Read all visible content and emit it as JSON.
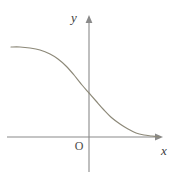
{
  "figure": {
    "background_color": "#ffffff",
    "width": 174,
    "height": 178
  },
  "axes": {
    "x_axis": {
      "label": "x",
      "color": "#8a8a8a",
      "start_x": 7,
      "end_x": 163,
      "y": 137,
      "arrow": "right"
    },
    "y_axis": {
      "label": "y",
      "color": "#8a8a8a",
      "x": 89,
      "start_y": 172,
      "end_y": 16,
      "arrow": "up"
    },
    "origin": {
      "label": "O",
      "color": "#4a4a4a",
      "x": 78,
      "y": 148
    }
  },
  "chart_data": {
    "type": "line",
    "title": "",
    "xlabel": "x",
    "ylabel": "y",
    "grid": false,
    "legend": null,
    "curve_color": "#8c8878",
    "origin_px": [
      89,
      137
    ],
    "xlim_px": [
      7,
      163
    ],
    "ylim_px": [
      16,
      172
    ],
    "points_px": [
      [
        11,
        47
      ],
      [
        20,
        47
      ],
      [
        30,
        48
      ],
      [
        40,
        50
      ],
      [
        50,
        54
      ],
      [
        58,
        59
      ],
      [
        66,
        66
      ],
      [
        74,
        75
      ],
      [
        82,
        85
      ],
      [
        89,
        93
      ],
      [
        96,
        101
      ],
      [
        104,
        110
      ],
      [
        112,
        118
      ],
      [
        120,
        124
      ],
      [
        128,
        129
      ],
      [
        136,
        133
      ],
      [
        144,
        135
      ],
      [
        152,
        136
      ],
      [
        160,
        137
      ]
    ],
    "series": [
      {
        "name": "y = f(x)",
        "x": [
          -8.5,
          -7.0,
          -5.5,
          -4.0,
          -2.5,
          -1.5,
          -0.5,
          0.0,
          0.5,
          1.5,
          2.5,
          4.0,
          5.5,
          7.0,
          8.5
        ],
        "y": [
          9.0,
          8.95,
          8.8,
          8.4,
          7.5,
          6.6,
          5.3,
          4.8,
          4.2,
          3.0,
          1.9,
          0.9,
          0.4,
          0.2,
          0.1
        ]
      }
    ]
  }
}
